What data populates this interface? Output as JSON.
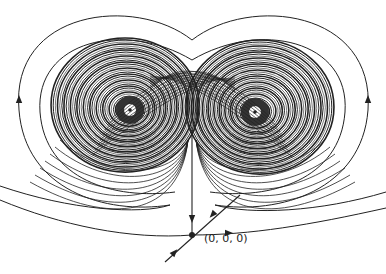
{
  "figure": {
    "origin_label": "(0, 0, 0)",
    "colors": {
      "ink": "#222222",
      "background": "#ffffff"
    },
    "fixed_points": [
      {
        "name": "left-focus",
        "x": 130,
        "y": 110
      },
      {
        "name": "right-focus",
        "x": 255,
        "y": 112
      },
      {
        "name": "origin",
        "x": 192,
        "y": 235
      }
    ],
    "arrows": [
      {
        "name": "left-outer-arrow",
        "x": 19,
        "y": 100,
        "direction": "up"
      },
      {
        "name": "right-outer-arrow",
        "x": 368,
        "y": 100,
        "direction": "up"
      },
      {
        "name": "stable-manifold-arrow",
        "x": 192,
        "y": 218,
        "direction": "down"
      },
      {
        "name": "unstable-manifold-arrow-upper",
        "x": 213,
        "y": 214,
        "direction": "down-left"
      },
      {
        "name": "unstable-manifold-arrow-lower",
        "x": 174,
        "y": 253,
        "direction": "up-right"
      },
      {
        "name": "right-lower-arrow",
        "x": 228,
        "y": 233,
        "direction": "right"
      }
    ]
  }
}
